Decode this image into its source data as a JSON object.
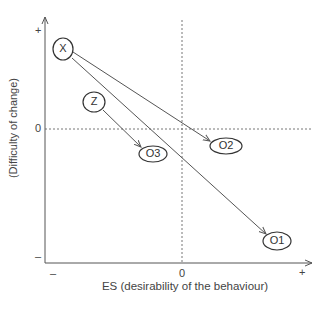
{
  "diagram": {
    "x_axis": {
      "label": "ES (desirability of the behaviour)",
      "ticks": {
        "min": "–",
        "zero": "0",
        "max": "+"
      }
    },
    "y_axis": {
      "label": "(Difficulty of change)",
      "ticks": {
        "max": "+",
        "zero": "0",
        "min": "–"
      }
    },
    "nodes": [
      {
        "id": "X",
        "label": "X"
      },
      {
        "id": "Z",
        "label": "Z"
      },
      {
        "id": "O3",
        "label": "O3"
      },
      {
        "id": "O2",
        "label": "O2"
      },
      {
        "id": "O1",
        "label": "O1"
      }
    ],
    "edges": [
      {
        "from": "X",
        "to": "O2"
      },
      {
        "from": "X",
        "to": "O1"
      },
      {
        "from": "Z",
        "to": "O3"
      }
    ]
  }
}
